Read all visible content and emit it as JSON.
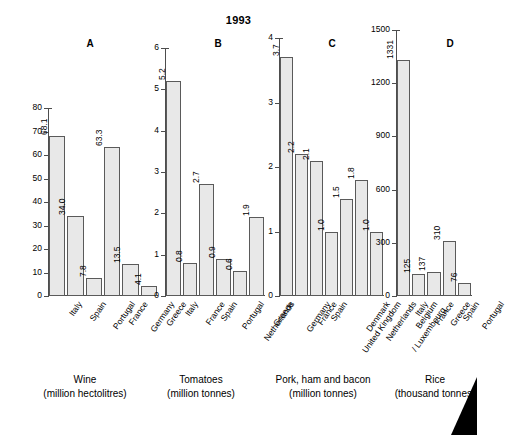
{
  "figure": {
    "title": "1993",
    "corner_marker": "black-triangle"
  },
  "chart_data": [
    {
      "type": "bar",
      "panel": "A",
      "title": "Wine",
      "subtitle": "(million hectolitres)",
      "xlabel": "",
      "ylabel": "",
      "ylim": [
        0,
        80
      ],
      "yticks": [
        0,
        10,
        20,
        30,
        40,
        50,
        60,
        70,
        80
      ],
      "grid": false,
      "legend": "none",
      "categories": [
        "Italy",
        "Spain",
        "Portugal",
        "France",
        "Germany",
        "Greece"
      ],
      "values": [
        68.1,
        34.0,
        7.8,
        63.3,
        13.5,
        4.1
      ],
      "value_labels": [
        "68.1",
        "34.0",
        "7.8",
        "63.3",
        "13.5",
        "4.1"
      ]
    },
    {
      "type": "bar",
      "panel": "B",
      "title": "Tomatoes",
      "subtitle": "(million tonnes)",
      "xlabel": "",
      "ylabel": "",
      "ylim": [
        0,
        6
      ],
      "yticks": [
        0,
        1,
        2,
        3,
        4,
        5,
        6
      ],
      "grid": false,
      "legend": "none",
      "categories": [
        "Italy",
        "France",
        "Spain",
        "Portugal",
        "Netherlands",
        "Greece"
      ],
      "values": [
        5.2,
        0.8,
        2.7,
        0.9,
        0.6,
        1.9
      ],
      "value_labels": [
        "5.2",
        "0.8",
        "2.7",
        "0.9",
        "0.6",
        "1.9"
      ]
    },
    {
      "type": "bar",
      "panel": "C",
      "title": "Pork, ham and bacon",
      "subtitle": "(million tonnes)",
      "xlabel": "",
      "ylabel": "",
      "ylim": [
        0,
        4
      ],
      "yticks": [
        0,
        1,
        2,
        3,
        4
      ],
      "grid": false,
      "legend": "none",
      "categories": [
        "Germany",
        "France",
        "Spain",
        "United Kingdom",
        "Denmark",
        "Netherlands",
        "Belgium\n/ Luxembourg"
      ],
      "values": [
        3.7,
        2.2,
        2.1,
        1.0,
        1.5,
        1.8,
        1.0
      ],
      "value_labels": [
        "3.7",
        "2.2",
        "2.1",
        "1.0",
        "1.5",
        "1.8",
        "1.0"
      ]
    },
    {
      "type": "bar",
      "panel": "D",
      "title": "Rice",
      "subtitle": "(thousand tonnes)",
      "xlabel": "",
      "ylabel": "",
      "ylim": [
        0,
        1500
      ],
      "yticks": [
        0,
        300,
        600,
        900,
        1200,
        1500
      ],
      "grid": false,
      "legend": "none",
      "categories": [
        "Italy",
        "France",
        "Greece",
        "Spain",
        "Portugal"
      ],
      "values": [
        1331,
        125,
        137,
        310,
        76
      ],
      "value_labels": [
        "1331",
        "125",
        "137",
        "310",
        "76"
      ]
    }
  ],
  "style": {
    "bar_fill": "#e8e8e8",
    "bar_stroke": "#5a5a5a",
    "axis_color": "#4d4d4d",
    "text_color": "#000000",
    "background": "#ffffff"
  }
}
